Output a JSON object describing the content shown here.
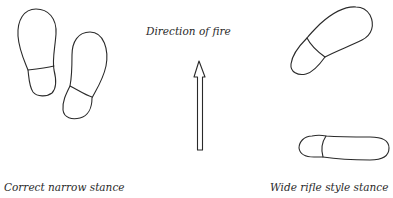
{
  "labels": {
    "direction": "Direction of fire",
    "left_caption": "Correct narrow stance",
    "right_caption": "Wide rifle style stance"
  },
  "colors": {
    "stroke": "#2a2a2a",
    "background": "#ffffff"
  },
  "icons": {
    "arrow": "up-arrow",
    "foot": "shoe-sole-outline"
  }
}
